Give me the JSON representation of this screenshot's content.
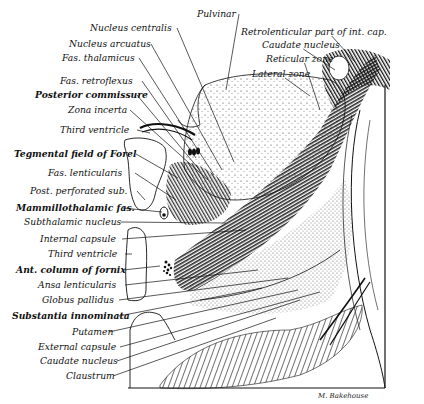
{
  "figure": {
    "signature": "M. Bakehouse",
    "labels_left": [
      {
        "id": "pulvinar",
        "text": "Pulvinar",
        "x": 197,
        "y": 8,
        "tx": 226,
        "ty": 90
      },
      {
        "id": "nucleus-centralis",
        "text": "Nucleus centralis",
        "x": 90,
        "y": 22,
        "tx": 234,
        "ty": 162
      },
      {
        "id": "nucleus-arcuatus",
        "text": "Nucleus arcuatus",
        "x": 69,
        "y": 38,
        "tx": 222,
        "ty": 170
      },
      {
        "id": "fas-thalamicus",
        "text": "Fas. thalamicus",
        "x": 62,
        "y": 52,
        "tx": 214,
        "ty": 175
      },
      {
        "id": "fas-retroflexus",
        "text": "Fas. retroflexus",
        "x": 60,
        "y": 75,
        "tx": 196,
        "ty": 158
      },
      {
        "id": "posterior-commissure",
        "text": "Posterior commissure",
        "x": 35,
        "y": 89,
        "tx": 198,
        "ty": 168
      },
      {
        "id": "zona-incerta",
        "text": "Zona incerta",
        "x": 68,
        "y": 104,
        "tx": 208,
        "ty": 180
      },
      {
        "id": "third-ventricle-upper",
        "text": "Third ventricle",
        "x": 60,
        "y": 124,
        "tx": 150,
        "ty": 133
      },
      {
        "id": "tegmental-field-of-forel",
        "text": "Tegmental field of Forel",
        "x": 14,
        "y": 148,
        "tx": 178,
        "ty": 178
      },
      {
        "id": "fas-lenticularis",
        "text": "Fas. lenticularis",
        "x": 48,
        "y": 167,
        "tx": 176,
        "ty": 200
      },
      {
        "id": "post-perforated-sub",
        "text": "Post. perforated sub.",
        "x": 30,
        "y": 185,
        "tx": 145,
        "ty": 200
      },
      {
        "id": "mammillothalamic-fas",
        "text": "Mammillothalamic fas.",
        "x": 16,
        "y": 202,
        "tx": 162,
        "ty": 212
      },
      {
        "id": "subthalamic-nucleus",
        "text": "Subthalamic nucleus",
        "x": 24,
        "y": 216,
        "tx": 226,
        "ty": 223
      },
      {
        "id": "internal-capsule",
        "text": "Internal capsule",
        "x": 40,
        "y": 233,
        "tx": 246,
        "ty": 230
      },
      {
        "id": "third-ventricle-lower",
        "text": "Third ventricle",
        "x": 48,
        "y": 248,
        "tx": 132,
        "ty": 254
      },
      {
        "id": "ant-column-of-fornix",
        "text": "Ant. column of fornix",
        "x": 16,
        "y": 264,
        "tx": 160,
        "ty": 266
      },
      {
        "id": "ansa-lenticularis",
        "text": "Ansa lenticularis",
        "x": 38,
        "y": 279,
        "tx": 258,
        "ty": 270
      },
      {
        "id": "globus-pallidus",
        "text": "Globus pallidus",
        "x": 42,
        "y": 294,
        "tx": 288,
        "ty": 278
      },
      {
        "id": "substantia-innominata",
        "text": "Substantia innominata",
        "x": 12,
        "y": 310,
        "tx": 262,
        "ty": 288
      },
      {
        "id": "putamen",
        "text": "Putamen",
        "x": 72,
        "y": 326,
        "tx": 298,
        "ty": 290
      },
      {
        "id": "external-capsule",
        "text": "External capsule",
        "x": 38,
        "y": 341,
        "tx": 320,
        "ty": 292
      },
      {
        "id": "caudate-nucleus-lower",
        "text": "Caudate nucleus",
        "x": 40,
        "y": 355,
        "tx": 300,
        "ty": 300
      },
      {
        "id": "claustrum",
        "text": "Claustrum",
        "x": 66,
        "y": 370,
        "tx": 276,
        "ty": 318
      }
    ],
    "labels_right": [
      {
        "id": "retrolenticular-part",
        "text": "Retrolenticular part of int. cap.",
        "x": 241,
        "y": 26,
        "tx": 355,
        "ty": 62
      },
      {
        "id": "caudate-nucleus-upper",
        "text": "Caudate nucleus",
        "x": 262,
        "y": 39,
        "tx": 335,
        "ty": 70
      },
      {
        "id": "reticular-zone",
        "text": "Reticular zone",
        "x": 266,
        "y": 53,
        "tx": 320,
        "ty": 110
      },
      {
        "id": "lateral-zone",
        "text": "Lateral zone",
        "x": 252,
        "y": 68,
        "tx": 310,
        "ty": 96
      }
    ],
    "bold_labels": [
      "posterior-commissure",
      "tegmental-field-of-forel",
      "mammillothalamic-fas",
      "ant-column-of-fornix",
      "substantia-innominata"
    ]
  }
}
